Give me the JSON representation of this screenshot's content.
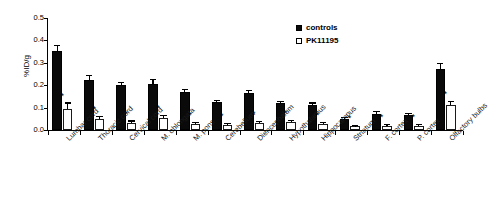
{
  "chart_data": {
    "type": "bar",
    "title": "",
    "xlabel": "",
    "ylabel": "%ID/g",
    "ylim": [
      0.0,
      0.5
    ],
    "yticks": [
      "0.0",
      "0.1",
      "0.2",
      "0.3",
      "0.4",
      "0.5"
    ],
    "grid": false,
    "legend_position": "top-right",
    "categories": [
      "Lumbar cord",
      "Thoracic cord",
      "Cervical cord",
      "M. oblongata",
      "M. pons",
      "Cerebellum",
      "Diencephalum",
      "Hypothalamus",
      "Hippocampus",
      "Striatum",
      "F. cortex",
      "P. cortex",
      "Olfactory bulbs"
    ],
    "series": [
      {
        "name": "controls",
        "color": "#0a0a0a",
        "values": [
          0.352,
          0.222,
          0.2,
          0.207,
          0.17,
          0.123,
          0.165,
          0.122,
          0.112,
          0.051,
          0.072,
          0.068,
          0.272
        ],
        "errors": [
          0.022,
          0.018,
          0.01,
          0.017,
          0.01,
          0.005,
          0.01,
          0.004,
          0.006,
          0.004,
          0.007,
          0.004,
          0.022
        ]
      },
      {
        "name": "PK11195",
        "color": "#ffffff",
        "values": [
          0.092,
          0.05,
          0.033,
          0.052,
          0.025,
          0.022,
          0.03,
          0.035,
          0.026,
          0.016,
          0.018,
          0.017,
          0.11
        ],
        "errors": [
          0.026,
          0.006,
          0.005,
          0.01,
          0.006,
          0.004,
          0.005,
          0.005,
          0.004,
          0.003,
          0.004,
          0.004,
          0.014
        ]
      }
    ],
    "significance_marker": "*",
    "significance_on_series": "PK11195",
    "significance_flags": [
      true,
      true,
      true,
      true,
      true,
      true,
      true,
      true,
      true,
      true,
      true,
      true,
      true
    ]
  },
  "legend": {
    "items": [
      {
        "label": "controls",
        "marker": "filled-square"
      },
      {
        "label": "PK11195",
        "marker": "open-square"
      }
    ]
  },
  "axis": {
    "y_label": "%ID/g"
  }
}
